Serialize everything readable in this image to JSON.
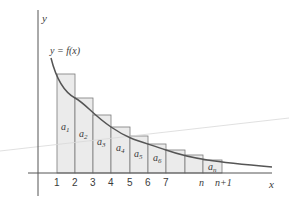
{
  "diagram": {
    "type": "riemann-sum-rectangles",
    "axis_labels": {
      "x": "x",
      "y": "y"
    },
    "curve_label": "y = f(x)",
    "tick_labels": [
      "1",
      "2",
      "3",
      "4",
      "5",
      "6",
      "7",
      "n",
      "n+1"
    ],
    "rectangle_labels": [
      {
        "base": "a",
        "sub": "1"
      },
      {
        "base": "a",
        "sub": "2"
      },
      {
        "base": "a",
        "sub": "3"
      },
      {
        "base": "a",
        "sub": "4"
      },
      {
        "base": "a",
        "sub": "5"
      },
      {
        "base": "a",
        "sub": "6"
      },
      {
        "base": "a",
        "sub": "n"
      }
    ],
    "colors": {
      "rect_fill": "#ebebeb",
      "rect_stroke": "#6e6e6e",
      "curve": "#555555",
      "axis": "#555555"
    }
  }
}
